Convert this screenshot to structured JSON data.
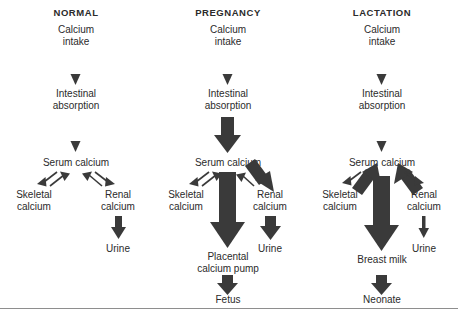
{
  "figure": {
    "type": "flow-diagram",
    "baseline_rule": true
  },
  "columns": [
    {
      "id": "normal",
      "title": "NORMAL",
      "nodes": {
        "intake": "Calcium\nintake",
        "absorption": "Intestinal\nabsorption",
        "serum": "Serum calcium",
        "skeletal": "Skeletal\ncalcium",
        "renal": "Renal\ncalcium",
        "urine": "Urine"
      },
      "flows": {
        "intake_to_absorption": "thin",
        "absorption_to_serum": "thin",
        "serum_to_skeletal": "thin",
        "skeletal_to_serum": "thin",
        "serum_to_renal": "thin",
        "renal_to_serum": "thin",
        "renal_to_urine": "medium"
      }
    },
    {
      "id": "pregnancy",
      "title": "PREGNANCY",
      "nodes": {
        "intake": "Calcium\nintake",
        "absorption": "Intestinal\nabsorption",
        "serum": "Serum calcium",
        "skeletal": "Skeletal\ncalcium",
        "renal": "Renal\ncalcium",
        "urine": "Urine",
        "sink": "Placental\ncalcium pump",
        "terminal": "Fetus"
      },
      "flows": {
        "intake_to_absorption": "thin",
        "absorption_to_serum": "thick",
        "serum_to_skeletal": "thin",
        "skeletal_to_serum": "thin",
        "serum_to_renal": "thick",
        "renal_to_serum": "thin",
        "renal_to_urine": "medium",
        "serum_to_sink": "very-thick",
        "sink_to_terminal": "medium"
      }
    },
    {
      "id": "lactation",
      "title": "LACTATION",
      "nodes": {
        "intake": "Calcium\nintake",
        "absorption": "Intestinal\nabsorption",
        "serum": "Serum calcium",
        "skeletal": "Skeletal\ncalcium",
        "renal": "Renal\ncalcium",
        "urine": "Urine",
        "sink": "Breast milk",
        "terminal": "Neonate"
      },
      "flows": {
        "intake_to_absorption": "thin",
        "absorption_to_serum": "thin",
        "serum_to_skeletal": "thin",
        "skeletal_to_serum": "thick",
        "serum_to_renal": "thin",
        "renal_to_serum": "thick",
        "renal_to_urine": "thin",
        "serum_to_sink": "very-thick",
        "sink_to_terminal": "medium"
      }
    }
  ],
  "colors": {
    "ink": "#2b2b2b",
    "arrow": "#3a3a3a",
    "rule": "#8e8e8e",
    "background": "#ffffff"
  }
}
